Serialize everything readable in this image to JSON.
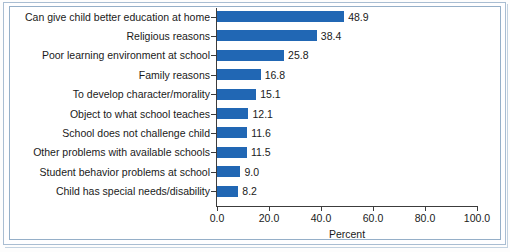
{
  "chart_data": {
    "type": "bar",
    "orientation": "horizontal",
    "title": "",
    "xlabel": "Percent",
    "ylabel": "",
    "xlim": [
      0.0,
      100.0
    ],
    "xticks": [
      "0.0",
      "20.0",
      "40.0",
      "60.0",
      "80.0",
      "100.0"
    ],
    "xtick_values": [
      0,
      20,
      40,
      60,
      80,
      100
    ],
    "grid": false,
    "legend": null,
    "bar_color": "#2167b4",
    "categories": [
      "Can give child better education at home",
      "Religious reasons",
      "Poor learning environment at school",
      "Family reasons",
      "To develop character/morality",
      "Object to what school teaches",
      "School does not challenge child",
      "Other problems with available schools",
      "Student behavior problems at school",
      "Child has special needs/disability"
    ],
    "values": [
      48.9,
      38.4,
      25.8,
      16.8,
      15.1,
      12.1,
      11.6,
      11.5,
      9.0,
      8.2
    ],
    "value_labels": [
      "48.9",
      "38.4",
      "25.8",
      "16.8",
      "15.1",
      "12.1",
      "11.6",
      "11.5",
      "9.0",
      "8.2"
    ]
  }
}
